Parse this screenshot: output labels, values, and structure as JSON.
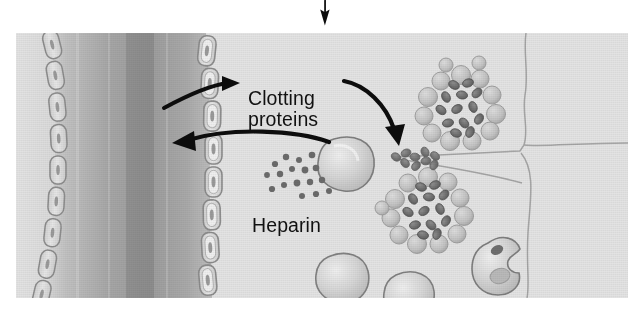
{
  "figure": {
    "background_color": "#e3e3e3",
    "page_background": "#ffffff",
    "ink_color": "#111111"
  },
  "pointer": {
    "top_arrow": {
      "icon": "arrow-down-icon",
      "direction": "down",
      "color": "#0d0d0d"
    }
  },
  "labels": [
    {
      "id": "clotting-proteins",
      "text": "Clotting\nproteins",
      "color": "#111111"
    },
    {
      "id": "heparin",
      "text": "Heparin",
      "color": "#111111"
    }
  ],
  "annotations": {
    "clotting_proteins": "Clotting\nproteins",
    "heparin": "Heparin"
  },
  "arrows": [
    {
      "id": "arrow-into-vessel-upper",
      "direction": "right",
      "meaning": "clotting proteins toward vessel label"
    },
    {
      "id": "arrow-into-vessel-lower",
      "direction": "left",
      "meaning": "heparin released into vessel lumen"
    },
    {
      "id": "arrow-to-granules",
      "direction": "down-right",
      "meaning": "clotting proteins toward tissue granules"
    }
  ],
  "structures": {
    "vessel": {
      "name": "blood-vessel-lumen",
      "fill_light": "#c9c9c9",
      "fill_dark": "#9d9d9d"
    },
    "endothelium": {
      "name": "endothelial-cell-lining",
      "cell_count": 9,
      "cell_fill": "#dcdcdc",
      "cell_stroke": "#8e8e8e",
      "nucleus_fill": "#9a9a9a"
    },
    "tissue": {
      "name": "connective-tissue",
      "boundary_stroke": "#9b9b9b"
    }
  },
  "cells": [
    {
      "id": "mast-cell-degranulating",
      "type": "mast cell",
      "fill": "#d2d2d2",
      "stroke": "#7e7e7e"
    },
    {
      "id": "mast-cell-cluster-upper",
      "type": "granulated mast cell",
      "granule_color": "#6f6f6f",
      "vesicle_color": "#bfbfbf"
    },
    {
      "id": "mast-cell-cluster-lower",
      "type": "granulated mast cell",
      "granule_color": "#6f6f6f",
      "vesicle_color": "#bfbfbf"
    },
    {
      "id": "granule-strand",
      "type": "released granules",
      "granule_color": "#8a8a8a"
    },
    {
      "id": "macrophage",
      "type": "macrophage",
      "fill": "#cfcfcf",
      "stroke": "#7e7e7e"
    },
    {
      "id": "tissue-cell-left",
      "type": "tissue cell",
      "fill": "#d4d4d4",
      "stroke": "#808080"
    },
    {
      "id": "tissue-cell-right",
      "type": "tissue cell",
      "fill": "#d4d4d4",
      "stroke": "#808080"
    }
  ],
  "particles": {
    "heparin_dots": {
      "name": "heparin-granule-dots",
      "count": 17,
      "color": "#6b6b6b"
    }
  }
}
